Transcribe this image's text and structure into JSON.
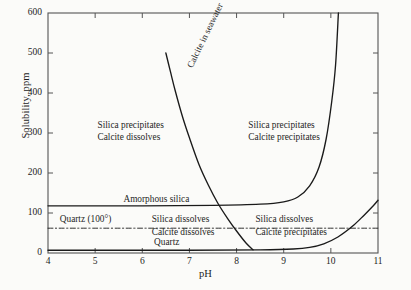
{
  "chart_data": {
    "type": "line",
    "title": "",
    "xlabel": "pH",
    "ylabel": "Solubility, ppm",
    "xlim": [
      4,
      11
    ],
    "ylim": [
      0,
      600
    ],
    "grid": false,
    "legend_position": "none",
    "xticks": [
      "4",
      "5",
      "6",
      "7",
      "8",
      "9",
      "10",
      "11"
    ],
    "yticks": [
      "0",
      "100",
      "200",
      "300",
      "400",
      "500",
      "600"
    ],
    "series": [
      {
        "name": "Calcite in seawater",
        "style": "solid",
        "x": [
          6.5,
          6.6,
          6.7,
          6.85,
          7.0,
          7.2,
          7.4,
          7.6,
          7.8,
          8.0,
          8.2,
          8.35
        ],
        "y": [
          500,
          452,
          405,
          342,
          288,
          222,
          170,
          125,
          88,
          55,
          25,
          8
        ]
      },
      {
        "name": "Amorphous silica",
        "style": "solid",
        "x": [
          4.0,
          6.0,
          7.5,
          8.5,
          9.0,
          9.3,
          9.55,
          9.75,
          9.9,
          10.02,
          10.1,
          10.16
        ],
        "y": [
          118,
          118,
          119,
          122,
          128,
          140,
          168,
          215,
          285,
          380,
          470,
          600
        ]
      },
      {
        "name": "Quartz",
        "style": "solid",
        "x": [
          4.0,
          7.0,
          8.5,
          9.2,
          9.55,
          9.85,
          10.15,
          10.45,
          10.7,
          10.9,
          11.0
        ],
        "y": [
          7,
          7,
          8,
          10,
          14,
          23,
          40,
          66,
          94,
          118,
          132
        ]
      },
      {
        "name": "Quartz (100°)",
        "style": "dashed",
        "x": [
          4.0,
          11.0
        ],
        "y": [
          62,
          62
        ]
      }
    ],
    "annotations": [
      {
        "id": "top-left-block",
        "text": "Silica precipitates\nCalcite dissolves",
        "x": 5.05,
        "y": 320
      },
      {
        "id": "top-right-block",
        "text": "Silica precipitates\nCalcite precipitates",
        "x": 8.25,
        "y": 320
      },
      {
        "id": "curve-label-calcite",
        "text": "Calcite in seawater",
        "x": 6.9,
        "y": 470,
        "rotation": -64
      },
      {
        "id": "amorphous-silica-label",
        "text": "Amorphous silica",
        "x": 5.6,
        "y": 135
      },
      {
        "id": "quartz-100-label",
        "text": "Quartz (100°)",
        "x": 4.25,
        "y": 84
      },
      {
        "id": "quartz-label",
        "text": "Quartz",
        "x": 6.25,
        "y": 28
      },
      {
        "id": "mid-left-block",
        "text": "Silica dissolves\nCalcite dissolves",
        "x": 6.2,
        "y": 84
      },
      {
        "id": "mid-right-block",
        "text": "Silica dissolves\nCalcite precipitates",
        "x": 8.4,
        "y": 84
      }
    ]
  },
  "axes": {
    "y_title": "Solubility, ppm",
    "x_title": "pH"
  },
  "labels": {
    "silica_precipitates": "Silica precipitates",
    "calcite_dissolves": "Calcite dissolves",
    "calcite_precipitates": "Calcite precipitates",
    "silica_dissolves": "Silica dissolves",
    "calcite_in_seawater": "Calcite in seawater",
    "amorphous_silica": "Amorphous silica",
    "quartz_100": "Quartz (100°)",
    "quartz": "Quartz"
  },
  "colors": {
    "background": "#fbfbf9",
    "axis": "#555555",
    "curve": "#1a1a1a",
    "text": "#1f1f1f"
  }
}
